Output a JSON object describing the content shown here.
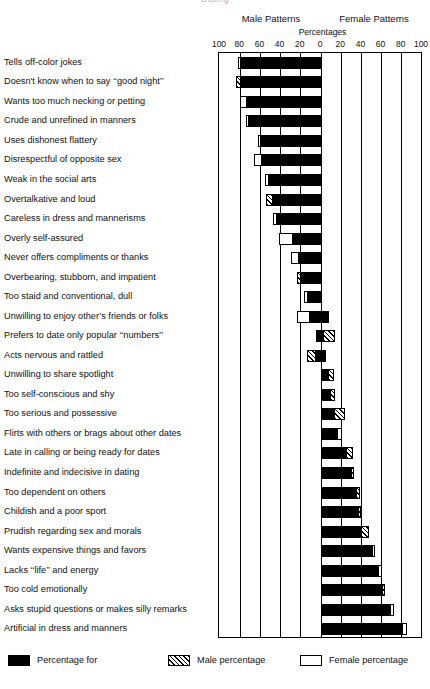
{
  "header": {
    "title_partial": "Dating",
    "male_patterns": "Male Patterns",
    "female_patterns": "Female Patterns",
    "percentages": "Percentages"
  },
  "legend": [
    {
      "swatch": "black",
      "label": "Percentage for"
    },
    {
      "swatch": "hatch",
      "label": "Male percentage"
    },
    {
      "swatch": "white",
      "label": "Female percentage"
    }
  ],
  "chart_data": {
    "type": "bar",
    "orientation": "horizontal",
    "style": "diverging-bidirectional",
    "title": "Dating",
    "xlabel": "Percentages",
    "ylabel": "",
    "xlim": [
      -100,
      100
    ],
    "xticks": [
      -100,
      -80,
      -60,
      -40,
      -20,
      0,
      20,
      40,
      60,
      80,
      100
    ],
    "xticklabels": [
      "100",
      "80",
      "60",
      "40",
      "20",
      "0",
      "20",
      "40",
      "60",
      "80",
      "100"
    ],
    "grid": true,
    "legend_position": "bottom",
    "left_axis_name": "Male Patterns",
    "right_axis_name": "Female Patterns",
    "series": [
      {
        "name": "Percentage for",
        "swatch": "black"
      },
      {
        "name": "Male percentage",
        "swatch": "hatch"
      },
      {
        "name": "Female percentage",
        "swatch": "white"
      }
    ],
    "categories": [
      "Tells off-color jokes",
      "Doesn't know when to say ‘‘good night’’",
      "Wants too much necking or petting",
      "Crude and unrefined in manners",
      "Uses dishonest flattery",
      "Disrespectful of opposite sex",
      "Weak in the social arts",
      "Overtalkative and loud",
      "Careless in dress and mannerisms",
      "Overly self-assured",
      "Never offers compliments or thanks",
      "Overbearing, stubborn, and impatient",
      "Too staid and conventional, dull",
      "Unwilling to enjoy other’s friends or folks",
      "Prefers to date only popular ‘‘numbers’’",
      "Acts nervous and rattled",
      "Unwilling to share spotlight",
      "Too self-conscious and shy",
      "Too serious and possessive",
      "Flirts with others or brags about other dates",
      "Late in calling or being ready for dates",
      "Indefinite and indecisive in dating",
      "Too dependent on others",
      "Childish and a poor sport",
      "Prudish regarding sex and morals",
      "Wants expensive things and favors",
      "Lacks ‘‘life’’ and energy",
      "Too cold emotionally",
      "Asks stupid questions or makes silly remarks",
      "Artificial in dress and manners"
    ],
    "rows": [
      {
        "category": "Tells off-color jokes",
        "black_from": -80,
        "black_to": 0,
        "tail": "white",
        "tail_from": -82,
        "tail_to": -80
      },
      {
        "category": "Doesn't know when to say ‘‘good night’’",
        "black_from": -79,
        "black_to": 0,
        "tail": "hatch",
        "tail_from": -84,
        "tail_to": -79
      },
      {
        "category": "Wants too much necking or petting",
        "black_from": -73,
        "black_to": 0,
        "tail": "white",
        "tail_from": -80,
        "tail_to": -73
      },
      {
        "category": "Crude and unrefined in manners",
        "black_from": -71,
        "black_to": 0,
        "tail": "white",
        "tail_from": -74,
        "tail_to": -71
      },
      {
        "category": "Uses dishonest flattery",
        "black_from": -60,
        "black_to": 0,
        "tail": "white",
        "tail_from": -62,
        "tail_to": -60
      },
      {
        "category": "Disrespectful of opposite sex",
        "black_from": -58,
        "black_to": 0,
        "tail": "white",
        "tail_from": -66,
        "tail_to": -58
      },
      {
        "category": "Weak in the social arts",
        "black_from": -51,
        "black_to": 0,
        "tail": "white",
        "tail_from": -55,
        "tail_to": -51
      },
      {
        "category": "Overtalkative and loud",
        "black_from": -48,
        "black_to": 0,
        "tail": "hatch",
        "tail_from": -54,
        "tail_to": -48
      },
      {
        "category": "Careless in dress and mannerisms",
        "black_from": -44,
        "black_to": 0,
        "tail": "white",
        "tail_from": -48,
        "tail_to": -44
      },
      {
        "category": "Overly self-assured",
        "black_from": -28,
        "black_to": 0,
        "tail": "white",
        "tail_from": -42,
        "tail_to": -28
      },
      {
        "category": "Never offers compliments or thanks",
        "black_from": -22,
        "black_to": 0,
        "tail": "white",
        "tail_from": -30,
        "tail_to": -22
      },
      {
        "category": "Overbearing, stubborn, and impatient",
        "black_from": -20,
        "black_to": 0,
        "tail": "hatch",
        "tail_from": -24,
        "tail_to": -20
      },
      {
        "category": "Too staid and conventional, dull",
        "black_from": -13,
        "black_to": 0,
        "tail": "white",
        "tail_from": -17,
        "tail_to": -13
      },
      {
        "category": "Unwilling to enjoy other’s friends or folks",
        "black_from": -11,
        "black_to": 8,
        "tail": "white",
        "tail_from": -24,
        "tail_to": -11
      },
      {
        "category": "Prefers to date only popular ‘‘numbers’’",
        "black_from": -5,
        "black_to": 2,
        "tail": "hatch",
        "tail_from": 2,
        "tail_to": 14
      },
      {
        "category": "Acts nervous and rattled",
        "black_from": -5,
        "black_to": 5,
        "tail": "hatch",
        "tail_from": -14,
        "tail_to": -5
      },
      {
        "category": "Unwilling to share spotlight",
        "black_from": 0,
        "black_to": 7,
        "tail": "hatch",
        "tail_from": 7,
        "tail_to": 13
      },
      {
        "category": "Too self-conscious and shy",
        "black_from": 0,
        "black_to": 9,
        "tail": "hatch",
        "tail_from": 9,
        "tail_to": 14
      },
      {
        "category": "Too serious and possessive",
        "black_from": 0,
        "black_to": 13,
        "tail": "hatch",
        "tail_from": 13,
        "tail_to": 24
      },
      {
        "category": "Flirts with others or brags about other dates",
        "black_from": 0,
        "black_to": 16,
        "tail": "white",
        "tail_from": 16,
        "tail_to": 21
      },
      {
        "category": "Late in calling or being ready for dates",
        "black_from": 0,
        "black_to": 25,
        "tail": "hatch",
        "tail_from": 25,
        "tail_to": 32
      },
      {
        "category": "Indefinite and indecisive in dating",
        "black_from": 0,
        "black_to": 30,
        "tail": "hatch",
        "tail_from": 30,
        "tail_to": 33
      },
      {
        "category": "Too dependent on others",
        "black_from": 0,
        "black_to": 35,
        "tail": "hatch",
        "tail_from": 35,
        "tail_to": 39
      },
      {
        "category": "Childish and a poor sport",
        "black_from": 0,
        "black_to": 37,
        "tail": "hatch",
        "tail_from": 37,
        "tail_to": 40
      },
      {
        "category": "Prudish regarding sex and morals",
        "black_from": 0,
        "black_to": 40,
        "tail": "hatch",
        "tail_from": 40,
        "tail_to": 48
      },
      {
        "category": "Wants expensive things and favors",
        "black_from": 0,
        "black_to": 50,
        "tail": "white",
        "tail_from": 50,
        "tail_to": 53
      },
      {
        "category": "Lacks ‘‘life’’ and energy",
        "black_from": 0,
        "black_to": 56,
        "tail": "white",
        "tail_from": 56,
        "tail_to": 60
      },
      {
        "category": "Too cold emotionally",
        "black_from": 0,
        "black_to": 60,
        "tail": "hatch",
        "tail_from": 60,
        "tail_to": 63
      },
      {
        "category": "Asks stupid questions or makes silly remarks",
        "black_from": 0,
        "black_to": 68,
        "tail": "white",
        "tail_from": 68,
        "tail_to": 72
      },
      {
        "category": "Artificial in dress and manners",
        "black_from": 0,
        "black_to": 80,
        "tail": "white",
        "tail_from": 80,
        "tail_to": 85
      }
    ]
  }
}
